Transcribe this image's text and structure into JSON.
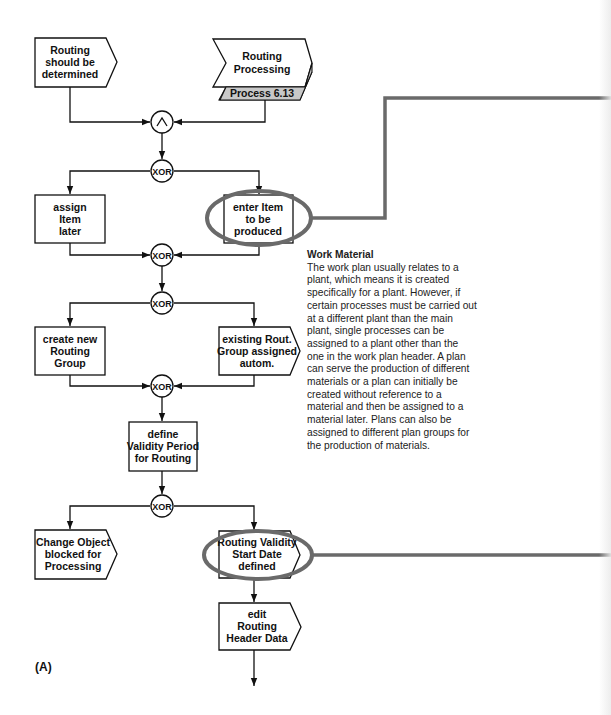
{
  "figure_label": "(A)",
  "nodes": {
    "routing_should_be_determined": [
      "Routing",
      "should be",
      "determined"
    ],
    "routing_processing": [
      "Routing",
      "Processing"
    ],
    "routing_processing_tab": "Process 6.13",
    "assign_item_later": [
      "assign",
      "Item",
      "later"
    ],
    "enter_item_to_be_produced": [
      "enter Item",
      "to be",
      "produced"
    ],
    "create_new_routing_group": [
      "create new",
      "Routing",
      "Group"
    ],
    "existing_rout_group_assigned": [
      "existing Rout.",
      "Group assigned",
      "autom."
    ],
    "define_validity_period": [
      "define",
      "Validity Period",
      "for Routing"
    ],
    "change_object_blocked": [
      "Change  Object",
      "blocked for",
      "Processing"
    ],
    "routing_validity_start_date": [
      "Routing Validity",
      "Start Date",
      "defined"
    ],
    "edit_routing_header_data": [
      "edit",
      "Routing",
      "Header Data"
    ]
  },
  "connectors": {
    "and_symbol": "^",
    "xor_1": "XOR",
    "xor_2": "XOR",
    "xor_3": "XOR",
    "xor_4": "XOR",
    "xor_5": "XOR"
  },
  "annotation": {
    "title": "Work Material",
    "body": "The work plan usually relates to a plant, which means it is created specifically for a plant. However, if certain processes must be carried out at a different plant than the main plant, single processes can be assigned to a plant other than the one in the work plan header. A plan can serve the production of different materials or a plan can initially be created without reference to a material and then be assigned to a material later. Plans can also be assigned to different plan groups for the production of materials."
  },
  "colors": {
    "highlight": "#6a6a6a",
    "tab_fill": "#c8c8c8",
    "stroke": "#111111"
  }
}
